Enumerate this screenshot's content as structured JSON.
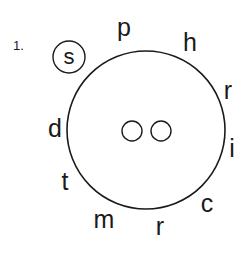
{
  "puzzle": {
    "number": "1.",
    "circled_letter": "s",
    "wheel_letters": [
      {
        "letter": "p",
        "x": 124,
        "y": 27
      },
      {
        "letter": "h",
        "x": 190,
        "y": 42
      },
      {
        "letter": "r",
        "x": 228,
        "y": 90
      },
      {
        "letter": "i",
        "x": 232,
        "y": 148
      },
      {
        "letter": "c",
        "x": 207,
        "y": 203
      },
      {
        "letter": "r",
        "x": 160,
        "y": 226
      },
      {
        "letter": "m",
        "x": 104,
        "y": 219
      },
      {
        "letter": "t",
        "x": 65,
        "y": 181
      },
      {
        "letter": "d",
        "x": 55,
        "y": 128
      }
    ],
    "center_blanks": 2
  }
}
